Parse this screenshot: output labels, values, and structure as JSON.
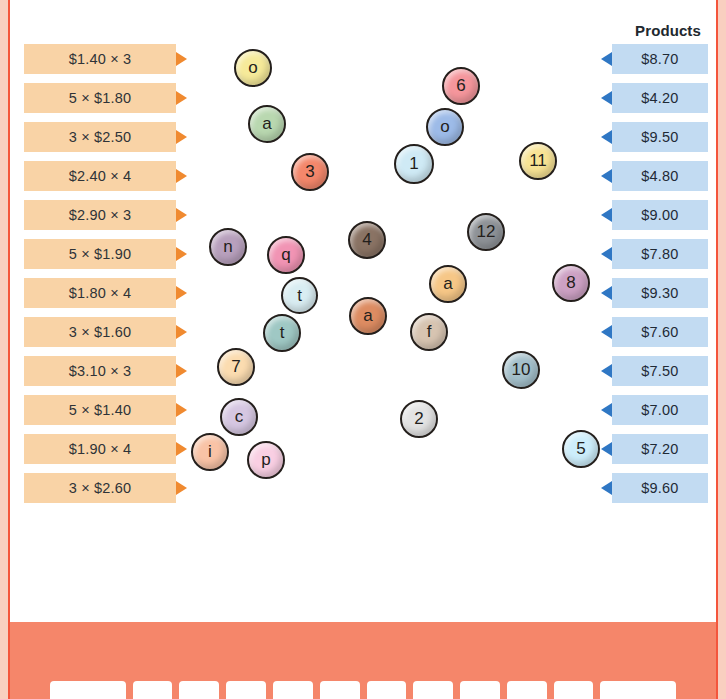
{
  "frame": {
    "border_color": "#f4553c",
    "band_color": "#f9cfc0",
    "bottom_color": "#f5866a"
  },
  "headers": {
    "products": "Products"
  },
  "factors": {
    "bar_color": "#f9d3a6",
    "arrow_color": "#f08a30",
    "items": [
      {
        "label": "$1.40 × 3",
        "top": 44
      },
      {
        "label": "5 × $1.80",
        "top": 83
      },
      {
        "label": "3 × $2.50",
        "top": 122
      },
      {
        "label": "$2.40 × 4",
        "top": 161
      },
      {
        "label": "$2.90 × 3",
        "top": 200
      },
      {
        "label": "5 × $1.90",
        "top": 239
      },
      {
        "label": "$1.80 × 4",
        "top": 278
      },
      {
        "label": "3 × $1.60",
        "top": 317
      },
      {
        "label": "$3.10 × 3",
        "top": 356
      },
      {
        "label": "5 × $1.40",
        "top": 395
      },
      {
        "label": "$1.90 × 4",
        "top": 434
      },
      {
        "label": "3 × $2.60",
        "top": 473
      }
    ]
  },
  "products": {
    "bar_color": "#c2dbf2",
    "arrow_color": "#2f77c4",
    "items": [
      {
        "label": "$8.70",
        "top": 44
      },
      {
        "label": "$4.20",
        "top": 83
      },
      {
        "label": "$9.50",
        "top": 122
      },
      {
        "label": "$4.80",
        "top": 161
      },
      {
        "label": "$9.00",
        "top": 200
      },
      {
        "label": "$7.80",
        "top": 239
      },
      {
        "label": "$9.30",
        "top": 278
      },
      {
        "label": "$7.60",
        "top": 317
      },
      {
        "label": "$7.50",
        "top": 356
      },
      {
        "label": "$7.00",
        "top": 395
      },
      {
        "label": "$7.20",
        "top": 434
      },
      {
        "label": "$9.60",
        "top": 473
      }
    ]
  },
  "tokens": [
    {
      "label": "o",
      "x": 222,
      "y": 49,
      "size": 38,
      "color": "#f6ea9a"
    },
    {
      "label": "a",
      "x": 236,
      "y": 105,
      "size": 38,
      "color": "#b9d8b0"
    },
    {
      "label": "3",
      "x": 279,
      "y": 153,
      "size": 38,
      "color": "#f4876b"
    },
    {
      "label": "6",
      "x": 430,
      "y": 67,
      "size": 38,
      "color": "#f5969c"
    },
    {
      "label": "o",
      "x": 414,
      "y": 108,
      "size": 38,
      "color": "#9dbbe8"
    },
    {
      "label": "1",
      "x": 382,
      "y": 144,
      "size": 40,
      "color": "#cfeaf5"
    },
    {
      "label": "11",
      "x": 507,
      "y": 142,
      "size": 38,
      "color": "#f8e394"
    },
    {
      "label": "n",
      "x": 197,
      "y": 228,
      "size": 38,
      "color": "#b8a0bd"
    },
    {
      "label": "q",
      "x": 255,
      "y": 236,
      "size": 38,
      "color": "#f194b4"
    },
    {
      "label": "4",
      "x": 336,
      "y": 221,
      "size": 38,
      "color": "#8a7364"
    },
    {
      "label": "12",
      "x": 455,
      "y": 213,
      "size": 38,
      "color": "#8e9297"
    },
    {
      "label": "t",
      "x": 269,
      "y": 277,
      "size": 37,
      "color": "#d9edf2"
    },
    {
      "label": "a",
      "x": 417,
      "y": 265,
      "size": 38,
      "color": "#f6c787"
    },
    {
      "label": "8",
      "x": 540,
      "y": 264,
      "size": 38,
      "color": "#cda1c4"
    },
    {
      "label": "t",
      "x": 251,
      "y": 314,
      "size": 38,
      "color": "#9fc8c4"
    },
    {
      "label": "a",
      "x": 337,
      "y": 297,
      "size": 38,
      "color": "#dd8c62"
    },
    {
      "label": "f",
      "x": 398,
      "y": 313,
      "size": 38,
      "color": "#d7c4b1"
    },
    {
      "label": "7",
      "x": 205,
      "y": 348,
      "size": 38,
      "color": "#fbdcb0"
    },
    {
      "label": "10",
      "x": 490,
      "y": 351,
      "size": 38,
      "color": "#a4c0cb"
    },
    {
      "label": "c",
      "x": 208,
      "y": 398,
      "size": 38,
      "color": "#d6c7e2"
    },
    {
      "label": "2",
      "x": 388,
      "y": 400,
      "size": 38,
      "color": "#e3e3e3"
    },
    {
      "label": "i",
      "x": 179,
      "y": 433,
      "size": 38,
      "color": "#f9c3a6"
    },
    {
      "label": "p",
      "x": 235,
      "y": 441,
      "size": 38,
      "color": "#f9cfe3"
    },
    {
      "label": "5",
      "x": 550,
      "y": 430,
      "size": 38,
      "color": "#cdeefb"
    }
  ],
  "keyboard": {
    "keys": [
      "",
      "",
      "",
      "",
      "",
      "",
      "",
      "",
      "",
      "",
      "",
      ""
    ]
  }
}
